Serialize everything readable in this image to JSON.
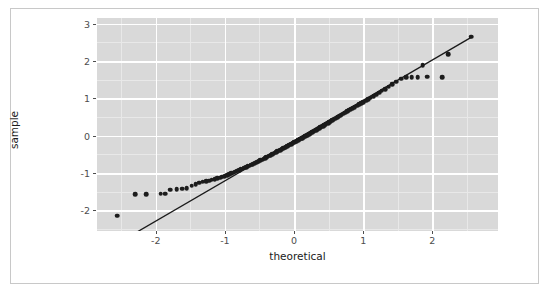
{
  "chart_data": {
    "type": "scatter",
    "title": "",
    "subtitle": "",
    "xlabel": "theoretical",
    "ylabel": "sample",
    "xlim": [
      -2.85,
      2.95
    ],
    "ylim": [
      -2.55,
      3.15
    ],
    "xticks": [
      -2,
      -1,
      0,
      1,
      2
    ],
    "xticklabels": [
      "-2",
      "-1",
      "0",
      "1",
      "2"
    ],
    "yticks": [
      -2,
      -1,
      0,
      1,
      2,
      3
    ],
    "yticklabels": [
      "-2",
      "-1",
      "0",
      "1",
      "2",
      "3"
    ],
    "grid": true,
    "grid_major": true,
    "grid_minor": true,
    "legend": "none",
    "panel_background": "#d9d9d9",
    "grid_major_color": "#ffffff",
    "grid_minor_color": "#e8e8e8",
    "point_color": "#1c1c1c",
    "line_color": "#1a1a1a",
    "frame_color": "#c8c8c8",
    "reference_line": {
      "label": "qq reference line",
      "x_start": -2.58,
      "y_start": -2.91,
      "x_end": 2.58,
      "y_end": 2.65,
      "slope": 1.0775,
      "intercept": -0.13
    },
    "series": [
      {
        "name": "sample quantiles",
        "points": [
          [
            -2.56,
            -2.14
          ],
          [
            -2.14,
            -1.56
          ],
          [
            -1.93,
            -1.55
          ],
          [
            -1.79,
            -1.45
          ],
          [
            -1.7,
            -1.43
          ],
          [
            -1.62,
            -1.42
          ],
          [
            -1.55,
            -1.4
          ],
          [
            -1.48,
            -1.34
          ],
          [
            -1.42,
            -1.3
          ],
          [
            -1.37,
            -1.26
          ],
          [
            -1.32,
            -1.23
          ],
          [
            -1.27,
            -1.21
          ],
          [
            -1.23,
            -1.2
          ],
          [
            -1.19,
            -1.18
          ],
          [
            -1.15,
            -1.16
          ],
          [
            -1.11,
            -1.14
          ],
          [
            -1.07,
            -1.12
          ],
          [
            -1.04,
            -1.1
          ],
          [
            -1.0,
            -1.08
          ],
          [
            -0.97,
            -1.05
          ],
          [
            -0.94,
            -1.03
          ],
          [
            -0.91,
            -1.01
          ],
          [
            -0.88,
            -0.99
          ],
          [
            -0.85,
            -0.96
          ],
          [
            -0.82,
            -0.94
          ],
          [
            -0.79,
            -0.92
          ],
          [
            -0.77,
            -0.9
          ],
          [
            -0.74,
            -0.88
          ],
          [
            -0.72,
            -0.86
          ],
          [
            -0.69,
            -0.84
          ],
          [
            -0.67,
            -0.82
          ],
          [
            -0.64,
            -0.8
          ],
          [
            -0.62,
            -0.78
          ],
          [
            -0.6,
            -0.76
          ],
          [
            -0.57,
            -0.74
          ],
          [
            -0.55,
            -0.72
          ],
          [
            -0.53,
            -0.7
          ],
          [
            -0.51,
            -0.68
          ],
          [
            -0.49,
            -0.66
          ],
          [
            -0.46,
            -0.64
          ],
          [
            -0.44,
            -0.62
          ],
          [
            -0.42,
            -0.6
          ],
          [
            -0.4,
            -0.58
          ],
          [
            -0.38,
            -0.56
          ],
          [
            -0.36,
            -0.54
          ],
          [
            -0.34,
            -0.52
          ],
          [
            -0.32,
            -0.5
          ],
          [
            -0.3,
            -0.48
          ],
          [
            -0.28,
            -0.46
          ],
          [
            -0.26,
            -0.44
          ],
          [
            -0.24,
            -0.42
          ],
          [
            -0.22,
            -0.4
          ],
          [
            -0.2,
            -0.38
          ],
          [
            -0.18,
            -0.36
          ],
          [
            -0.16,
            -0.34
          ],
          [
            -0.14,
            -0.32
          ],
          [
            -0.12,
            -0.3
          ],
          [
            -0.1,
            -0.28
          ],
          [
            -0.08,
            -0.26
          ],
          [
            -0.06,
            -0.24
          ],
          [
            -0.04,
            -0.22
          ],
          [
            -0.02,
            -0.2
          ],
          [
            0.0,
            -0.18
          ],
          [
            0.02,
            -0.16
          ],
          [
            0.04,
            -0.14
          ],
          [
            0.06,
            -0.12
          ],
          [
            0.08,
            -0.1
          ],
          [
            0.1,
            -0.08
          ],
          [
            0.12,
            -0.06
          ],
          [
            0.14,
            -0.04
          ],
          [
            0.16,
            -0.02
          ],
          [
            0.18,
            0.0
          ],
          [
            0.2,
            0.02
          ],
          [
            0.22,
            0.04
          ],
          [
            0.24,
            0.06
          ],
          [
            0.26,
            0.09
          ],
          [
            0.28,
            0.11
          ],
          [
            0.3,
            0.13
          ],
          [
            0.32,
            0.15
          ],
          [
            0.34,
            0.17
          ],
          [
            0.36,
            0.19
          ],
          [
            0.38,
            0.22
          ],
          [
            0.4,
            0.24
          ],
          [
            0.42,
            0.26
          ],
          [
            0.44,
            0.28
          ],
          [
            0.46,
            0.31
          ],
          [
            0.49,
            0.33
          ],
          [
            0.51,
            0.36
          ],
          [
            0.53,
            0.38
          ],
          [
            0.55,
            0.41
          ],
          [
            0.57,
            0.43
          ],
          [
            0.6,
            0.46
          ],
          [
            0.62,
            0.48
          ],
          [
            0.64,
            0.51
          ],
          [
            0.67,
            0.54
          ],
          [
            0.69,
            0.56
          ],
          [
            0.72,
            0.59
          ],
          [
            0.74,
            0.62
          ],
          [
            0.77,
            0.65
          ],
          [
            0.79,
            0.68
          ],
          [
            0.82,
            0.71
          ],
          [
            0.85,
            0.74
          ],
          [
            0.88,
            0.77
          ],
          [
            0.91,
            0.8
          ],
          [
            0.94,
            0.84
          ],
          [
            0.97,
            0.87
          ],
          [
            1.0,
            0.9
          ],
          [
            1.04,
            0.94
          ],
          [
            1.07,
            0.98
          ],
          [
            1.11,
            1.02
          ],
          [
            1.15,
            1.06
          ],
          [
            1.19,
            1.1
          ],
          [
            1.23,
            1.15
          ],
          [
            1.27,
            1.2
          ],
          [
            1.32,
            1.25
          ],
          [
            1.37,
            1.31
          ],
          [
            1.42,
            1.38
          ],
          [
            1.48,
            1.45
          ],
          [
            1.55,
            1.53
          ],
          [
            1.62,
            1.56
          ],
          [
            1.7,
            1.57
          ],
          [
            1.79,
            1.57
          ],
          [
            1.93,
            1.58
          ],
          [
            2.14,
            1.57
          ],
          [
            2.56,
            2.65
          ],
          [
            1.86,
            1.88
          ],
          [
            2.23,
            2.18
          ],
          [
            -1.86,
            -1.55
          ],
          [
            -2.3,
            -1.56
          ]
        ]
      }
    ]
  }
}
